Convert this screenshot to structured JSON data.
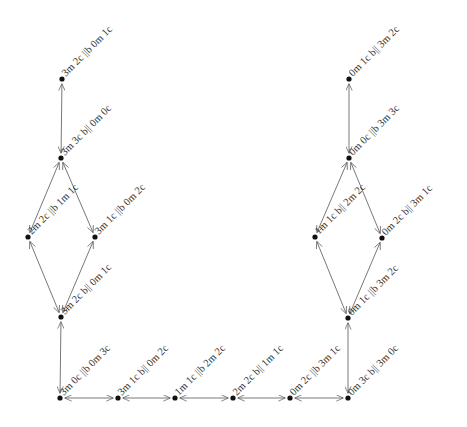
{
  "diagram": {
    "type": "state-graph",
    "title": "",
    "colors": {
      "node": "#111111",
      "edge": "#555555",
      "label": "#333333",
      "background": "#ffffff"
    },
    "nodes": [
      {
        "id": "n0",
        "x": 62,
        "y": 79,
        "label": "3m 2c ||b 0m 1c"
      },
      {
        "id": "n1",
        "x": 61,
        "y": 158,
        "label": "3m 3c b|| 0m 0c"
      },
      {
        "id": "n2",
        "x": 28,
        "y": 237,
        "label": "2m 2c ||b 1m 1c"
      },
      {
        "id": "n3",
        "x": 95,
        "y": 237,
        "label": "3m 1c ||b 0m 2c"
      },
      {
        "id": "n4",
        "x": 61,
        "y": 317,
        "label": "3m 2c b|| 0m 1c"
      },
      {
        "id": "n5",
        "x": 60,
        "y": 398,
        "label": "3m 0c ||b 0m 3c"
      },
      {
        "id": "n6",
        "x": 118,
        "y": 398,
        "label": "3m 1c b|| 0m 2c"
      },
      {
        "id": "n7",
        "x": 175,
        "y": 398,
        "label": "1m 1c ||b 2m 2c"
      },
      {
        "id": "n8",
        "x": 233,
        "y": 398,
        "label": "2m 2c b|| 1m 1c"
      },
      {
        "id": "n9",
        "x": 290,
        "y": 398,
        "label": "0m 2c ||b 3m 1c"
      },
      {
        "id": "n10",
        "x": 348,
        "y": 398,
        "label": "0m 3c b|| 3m 0c"
      },
      {
        "id": "n11",
        "x": 348,
        "y": 318,
        "label": "0m 1c ||b 3m 2c"
      },
      {
        "id": "n12",
        "x": 315,
        "y": 237,
        "label": "1m 1c b|| 2m 2c"
      },
      {
        "id": "n13",
        "x": 382,
        "y": 238,
        "label": "0m 2c b|| 3m 1c"
      },
      {
        "id": "n14",
        "x": 349,
        "y": 158,
        "label": "0m 0c ||b 3m 3c"
      },
      {
        "id": "n15",
        "x": 349,
        "y": 79,
        "label": "0m 1c b|| 3m 2c"
      }
    ],
    "edges": [
      {
        "from": "n0",
        "to": "n1"
      },
      {
        "from": "n1",
        "to": "n2"
      },
      {
        "from": "n1",
        "to": "n3"
      },
      {
        "from": "n2",
        "to": "n4"
      },
      {
        "from": "n3",
        "to": "n4"
      },
      {
        "from": "n4",
        "to": "n5"
      },
      {
        "from": "n5",
        "to": "n6"
      },
      {
        "from": "n6",
        "to": "n7"
      },
      {
        "from": "n7",
        "to": "n8"
      },
      {
        "from": "n8",
        "to": "n9"
      },
      {
        "from": "n9",
        "to": "n10"
      },
      {
        "from": "n10",
        "to": "n11"
      },
      {
        "from": "n11",
        "to": "n12"
      },
      {
        "from": "n11",
        "to": "n13"
      },
      {
        "from": "n12",
        "to": "n14"
      },
      {
        "from": "n13",
        "to": "n14"
      },
      {
        "from": "n14",
        "to": "n15"
      }
    ]
  }
}
